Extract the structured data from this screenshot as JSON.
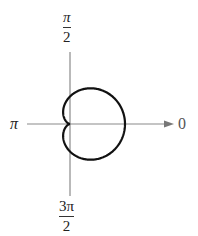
{
  "chart_data": {
    "type": "line",
    "coordinate_system": "polar",
    "curve": "cardioid",
    "equation_form": "r = a(1 + cos θ)",
    "cusp": "origin (pole), pointing toward θ = π",
    "axis_labels": {
      "right": "0",
      "top": {
        "numerator": "π",
        "denominator": "2"
      },
      "left": "π",
      "bottom": {
        "numerator": "3π",
        "denominator": "2"
      }
    },
    "grid": false,
    "title": "",
    "line_color": "#111111",
    "axis_color": "#888888"
  },
  "labels": {
    "zero": "0",
    "pi": "π",
    "half_pi_num": "π",
    "half_pi_den": "2",
    "three_half_pi_num": "3π",
    "three_half_pi_den": "2"
  }
}
